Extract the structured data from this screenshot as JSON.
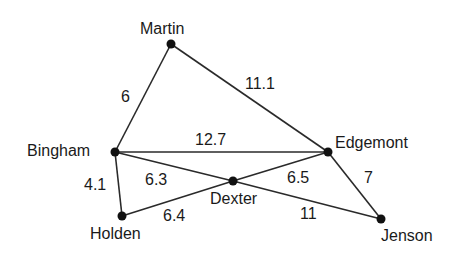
{
  "nodes": [
    {
      "id": "martin",
      "label": "Martin",
      "x": 171,
      "y": 44,
      "label_x": 140,
      "label_y": 21
    },
    {
      "id": "bingham",
      "label": "Bingham",
      "x": 115,
      "y": 152,
      "label_x": 27,
      "label_y": 143
    },
    {
      "id": "edgemont",
      "label": "Edgemont",
      "x": 328,
      "y": 152,
      "label_x": 335,
      "label_y": 135
    },
    {
      "id": "dexter",
      "label": "Dexter",
      "x": 233,
      "y": 181,
      "label_x": 210,
      "label_y": 191
    },
    {
      "id": "holden",
      "label": "Holden",
      "x": 122,
      "y": 216,
      "label_x": 90,
      "label_y": 226
    },
    {
      "id": "jenson",
      "label": "Jenson",
      "x": 381,
      "y": 219,
      "label_x": 381,
      "label_y": 228
    }
  ],
  "edges": [
    {
      "from": "martin",
      "to": "bingham",
      "weight": "6",
      "label_x": 121,
      "label_y": 89
    },
    {
      "from": "martin",
      "to": "edgemont",
      "weight": "11.1",
      "label_x": 245,
      "label_y": 76
    },
    {
      "from": "bingham",
      "to": "edgemont",
      "weight": "12.7",
      "label_x": 195,
      "label_y": 132
    },
    {
      "from": "bingham",
      "to": "dexter",
      "weight": "6.3",
      "label_x": 145,
      "label_y": 172
    },
    {
      "from": "bingham",
      "to": "holden",
      "weight": "4.1",
      "label_x": 84,
      "label_y": 177
    },
    {
      "from": "holden",
      "to": "dexter",
      "weight": "6.4",
      "label_x": 163,
      "label_y": 208
    },
    {
      "from": "dexter",
      "to": "edgemont",
      "weight": "6.5",
      "label_x": 287,
      "label_y": 170
    },
    {
      "from": "dexter",
      "to": "jenson",
      "weight": "11",
      "label_x": 300,
      "label_y": 206
    },
    {
      "from": "edgemont",
      "to": "jenson",
      "weight": "7",
      "label_x": 364,
      "label_y": 170
    }
  ],
  "style": {
    "line_color": "#2a2a2a",
    "node_color": "#111111"
  }
}
